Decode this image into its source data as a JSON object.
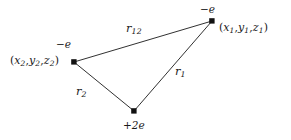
{
  "figure": {
    "type": "physics-diagram",
    "background_color": "#ffffff",
    "line_color": "#1a1a1a",
    "text_color": "#1a1a1a"
  },
  "vertices": [
    {
      "id": "electron-1",
      "charge_label": "−e",
      "charge_sign": "−",
      "charge_value": "e",
      "coord_open": "(",
      "coord_x": "x",
      "coord_x_sub": "1",
      "coord_y": "y",
      "coord_y_sub": "1",
      "coord_z": "z",
      "coord_z_sub": "1",
      "coord_close": ")",
      "comma": ",",
      "coord_text": "(x1, y1, z1)",
      "x": 212,
      "y": 21
    },
    {
      "id": "electron-2",
      "charge_label": "−e",
      "charge_sign": "−",
      "charge_value": "e",
      "coord_open": "(",
      "coord_x": "x",
      "coord_x_sub": "2",
      "coord_y": "y",
      "coord_y_sub": "2",
      "coord_z": "z",
      "coord_z_sub": "2",
      "coord_close": ")",
      "comma": ",",
      "coord_text": "(x2, y2, z2)",
      "x": 74,
      "y": 62
    },
    {
      "id": "nucleus",
      "charge_label": "+2e",
      "charge_sign": "+",
      "charge_value": "2e",
      "x": 134,
      "y": 111
    }
  ],
  "edges": [
    {
      "id": "r12",
      "label_base": "r",
      "label_sub": "12",
      "label_text": "r12",
      "from": "electron-2",
      "to": "electron-1",
      "x1": 74,
      "y1": 62,
      "x2": 212,
      "y2": 21
    },
    {
      "id": "r1",
      "label_base": "r",
      "label_sub": "1",
      "label_text": "r1",
      "from": "nucleus",
      "to": "electron-1",
      "x1": 134,
      "y1": 111,
      "x2": 212,
      "y2": 21
    },
    {
      "id": "r2",
      "label_base": "r",
      "label_sub": "2",
      "label_text": "r2",
      "from": "electron-2",
      "to": "nucleus",
      "x1": 74,
      "y1": 62,
      "x2": 134,
      "y2": 111
    }
  ]
}
